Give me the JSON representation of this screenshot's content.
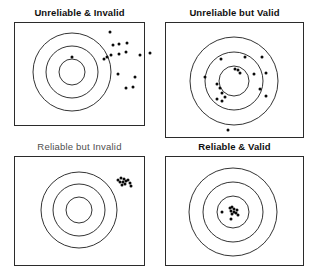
{
  "figure": {
    "background_color": "#ffffff",
    "ink_color": "#1d1d1d",
    "shot_color": "#0a0a0a",
    "width": 316,
    "height": 280
  },
  "panels": [
    {
      "id": "unreliable-invalid",
      "title": "Unreliable & Invalid",
      "title_style": "bold",
      "frame": {
        "x": 14,
        "y": 22,
        "w": 131,
        "h": 104
      },
      "target": {
        "cx": 72,
        "cy": 72,
        "r_outer": 39,
        "r_middle": 26,
        "r_inner": 13
      },
      "shots": [
        {
          "x": 110,
          "y": 32
        },
        {
          "x": 113,
          "y": 45
        },
        {
          "x": 119,
          "y": 44
        },
        {
          "x": 127,
          "y": 43
        },
        {
          "x": 111,
          "y": 55
        },
        {
          "x": 119,
          "y": 54
        },
        {
          "x": 126,
          "y": 52
        },
        {
          "x": 107,
          "y": 57
        },
        {
          "x": 72,
          "y": 57
        },
        {
          "x": 104,
          "y": 59
        },
        {
          "x": 140,
          "y": 55
        },
        {
          "x": 150,
          "y": 53
        },
        {
          "x": 118,
          "y": 74
        },
        {
          "x": 135,
          "y": 77
        },
        {
          "x": 126,
          "y": 88
        },
        {
          "x": 133,
          "y": 87
        }
      ]
    },
    {
      "id": "unreliable-valid",
      "title": "Unreliable but Valid",
      "title_style": "bold",
      "frame": {
        "x": 165,
        "y": 22,
        "w": 139,
        "h": 116
      },
      "target": {
        "cx": 234,
        "cy": 81,
        "r_outer": 44,
        "r_middle": 29,
        "r_inner": 15
      },
      "shots": [
        {
          "x": 221,
          "y": 59
        },
        {
          "x": 245,
          "y": 57
        },
        {
          "x": 262,
          "y": 57
        },
        {
          "x": 235,
          "y": 69
        },
        {
          "x": 238,
          "y": 70
        },
        {
          "x": 240,
          "y": 73
        },
        {
          "x": 254,
          "y": 74
        },
        {
          "x": 205,
          "y": 77
        },
        {
          "x": 266,
          "y": 73
        },
        {
          "x": 217,
          "y": 84
        },
        {
          "x": 220,
          "y": 88
        },
        {
          "x": 222,
          "y": 93
        },
        {
          "x": 260,
          "y": 89
        },
        {
          "x": 225,
          "y": 97
        },
        {
          "x": 217,
          "y": 99
        },
        {
          "x": 222,
          "y": 101
        },
        {
          "x": 266,
          "y": 96
        },
        {
          "x": 228,
          "y": 130
        }
      ]
    },
    {
      "id": "reliable-invalid",
      "title": "Reliable but Invalid",
      "title_style": "light",
      "frame": {
        "x": 14,
        "y": 156,
        "w": 131,
        "h": 110
      },
      "target": {
        "cx": 79,
        "cy": 210,
        "r_outer": 38,
        "r_middle": 26,
        "r_inner": 13
      },
      "shots": [
        {
          "x": 118,
          "y": 180
        },
        {
          "x": 121,
          "y": 178
        },
        {
          "x": 124,
          "y": 179
        },
        {
          "x": 120,
          "y": 182
        },
        {
          "x": 123,
          "y": 182
        },
        {
          "x": 126,
          "y": 181
        },
        {
          "x": 128,
          "y": 180
        },
        {
          "x": 122,
          "y": 185
        },
        {
          "x": 125,
          "y": 184
        },
        {
          "x": 130,
          "y": 183
        },
        {
          "x": 131,
          "y": 186
        }
      ]
    },
    {
      "id": "reliable-valid",
      "title": "Reliable & Valid",
      "title_style": "bold",
      "frame": {
        "x": 165,
        "y": 156,
        "w": 139,
        "h": 110
      },
      "target": {
        "cx": 233,
        "cy": 212,
        "r_outer": 44,
        "r_middle": 30,
        "r_inner": 16
      },
      "shots": [
        {
          "x": 222,
          "y": 212
        },
        {
          "x": 230,
          "y": 208
        },
        {
          "x": 232,
          "y": 207
        },
        {
          "x": 234,
          "y": 209
        },
        {
          "x": 231,
          "y": 211
        },
        {
          "x": 234,
          "y": 212
        },
        {
          "x": 237,
          "y": 210
        },
        {
          "x": 236,
          "y": 213
        },
        {
          "x": 232,
          "y": 214
        },
        {
          "x": 238,
          "y": 215
        },
        {
          "x": 231,
          "y": 219
        }
      ]
    }
  ]
}
